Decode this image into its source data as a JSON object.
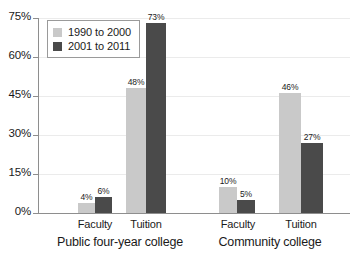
{
  "chart_data": {
    "type": "bar",
    "title": "",
    "subtitle": "",
    "xlabel": "",
    "ylabel": "",
    "ylim": [
      0,
      75
    ],
    "ytick_labels": [
      "0%",
      "15%",
      "30%",
      "45%",
      "60%",
      "75%"
    ],
    "ytick_values": [
      0,
      15,
      30,
      45,
      60,
      75
    ],
    "grid": true,
    "legend_position": "top-left-inside",
    "categories": [
      "Faculty",
      "Tuition",
      "Faculty",
      "Tuition"
    ],
    "groups": [
      {
        "label": "Public four-year college",
        "categories": [
          "Faculty",
          "Tuition"
        ]
      },
      {
        "label": "Community college",
        "categories": [
          "Faculty",
          "Tuition"
        ]
      }
    ],
    "series": [
      {
        "name": "1990 to 2000",
        "color": "#c9c9c9",
        "values": [
          4,
          48,
          10,
          46
        ],
        "value_labels": [
          "4%",
          "48%",
          "10%",
          "46%"
        ]
      },
      {
        "name": "2001 to 2011",
        "color": "#4a4a4a",
        "values": [
          6,
          73,
          5,
          27
        ],
        "value_labels": [
          "6%",
          "73%",
          "5%",
          "27%"
        ]
      }
    ]
  },
  "axis": {
    "y_ticks": [
      {
        "label": "75%",
        "value": 75
      },
      {
        "label": "60%",
        "value": 60
      },
      {
        "label": "45%",
        "value": 45
      },
      {
        "label": "30%",
        "value": 30
      },
      {
        "label": "15%",
        "value": 15
      },
      {
        "label": "0%",
        "value": 0
      }
    ]
  },
  "legend": {
    "entries": [
      {
        "label": "1990 to 2000",
        "color": "#c9c9c9"
      },
      {
        "label": "2001 to 2011",
        "color": "#4a4a4a"
      }
    ]
  },
  "bars": [
    {
      "label": "4%",
      "value": 4,
      "series": "1990 to 2000",
      "group": "Public four-year college",
      "category": "Faculty",
      "color": "#c9c9c9",
      "x": 78,
      "w": 17
    },
    {
      "label": "6%",
      "value": 6,
      "series": "2001 to 2011",
      "group": "Public four-year college",
      "category": "Faculty",
      "color": "#4a4a4a",
      "x": 95,
      "w": 17
    },
    {
      "label": "48%",
      "value": 48,
      "series": "1990 to 2000",
      "group": "Public four-year college",
      "category": "Tuition",
      "color": "#c9c9c9",
      "x": 126,
      "w": 20
    },
    {
      "label": "73%",
      "value": 73,
      "series": "2001 to 2011",
      "group": "Public four-year college",
      "category": "Tuition",
      "color": "#4a4a4a",
      "x": 146,
      "w": 20
    },
    {
      "label": "10%",
      "value": 10,
      "series": "1990 to 2000",
      "group": "Community college",
      "category": "Faculty",
      "color": "#c9c9c9",
      "x": 219,
      "w": 18
    },
    {
      "label": "5%",
      "value": 5,
      "series": "2001 to 2011",
      "group": "Community college",
      "category": "Faculty",
      "color": "#4a4a4a",
      "x": 237,
      "w": 18
    },
    {
      "label": "46%",
      "value": 46,
      "series": "1990 to 2000",
      "group": "Community college",
      "category": "Tuition",
      "color": "#c9c9c9",
      "x": 279,
      "w": 22
    },
    {
      "label": "27%",
      "value": 27,
      "series": "2001 to 2011",
      "group": "Community college",
      "category": "Tuition",
      "color": "#4a4a4a",
      "x": 301,
      "w": 22
    }
  ],
  "category_labels": [
    {
      "text": "Faculty",
      "cx": 95
    },
    {
      "text": "Tuition",
      "cx": 146
    },
    {
      "text": "Faculty",
      "cx": 238
    },
    {
      "text": "Tuition",
      "cx": 301
    }
  ],
  "group_labels": [
    {
      "text": "Public four-year college",
      "cx": 120
    },
    {
      "text": "Community college",
      "cx": 270
    }
  ]
}
